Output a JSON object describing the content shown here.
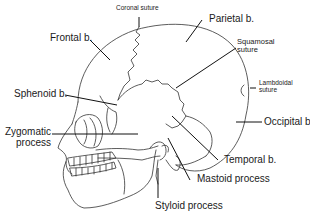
{
  "diagram": {
    "labels": {
      "coronal_suture": "Coronal suture",
      "frontal": "Frontal b.",
      "parietal": "Parietal b.",
      "squamosal_line1": "Squamosal",
      "squamosal_line2": "suture",
      "lambdoidal_line1": "Lambdoidal",
      "lambdoidal_line2": "suture",
      "sphenoid": "Sphenoid b.",
      "occipital": "Occipital b.",
      "zygomatic_line1": "Zygomatic",
      "zygomatic_line2": "process",
      "temporal": "Temporal b.",
      "mastoid": "Mastoid process",
      "styloid": "Styloid process"
    },
    "colors": {
      "line": "#333333",
      "leader": "#111111",
      "text": "#1a1a1a",
      "background": "#ffffff"
    }
  }
}
